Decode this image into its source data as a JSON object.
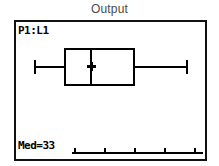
{
  "window": {
    "title": "Output"
  },
  "calculator_screen": {
    "plot_label": "P1:L1",
    "median_readout": "Med=33",
    "cursor_icon": "trace-cursor-x"
  },
  "chart_data": {
    "type": "box",
    "title": "Output",
    "plot_name": "P1:L1",
    "source_list": "L1",
    "orientation": "horizontal",
    "xlabel": "",
    "ylabel": "",
    "grid": false,
    "legend": null,
    "axis": {
      "visible": true,
      "tick_count": 5,
      "tick_labels": []
    },
    "series": [
      {
        "name": "P1:L1",
        "min": 9,
        "q1": 25,
        "median": 33,
        "q3": 53,
        "max": 78
      }
    ],
    "annotations": [
      {
        "text": "P1:L1",
        "position": "top-left"
      },
      {
        "text": "Med=33",
        "position": "bottom-left"
      }
    ],
    "cursor": {
      "on": "median",
      "value": 33,
      "readout": "Med=33"
    },
    "colors": {
      "ink": "#000000",
      "screen_background": "#ffffff",
      "title_text": "#4a4a4a"
    }
  },
  "geometry": {
    "whisker_left_x": 18,
    "box_left_x": 48,
    "median_x": 74,
    "box_right_x": 119,
    "whisker_right_x": 172,
    "plot_center_y": 45,
    "box_top_y": 26,
    "box_height": 38,
    "axis_y": 130,
    "axis_left_x": 56,
    "axis_right_x": 187,
    "tick_positions": [
      58,
      88,
      118,
      148,
      178
    ]
  }
}
